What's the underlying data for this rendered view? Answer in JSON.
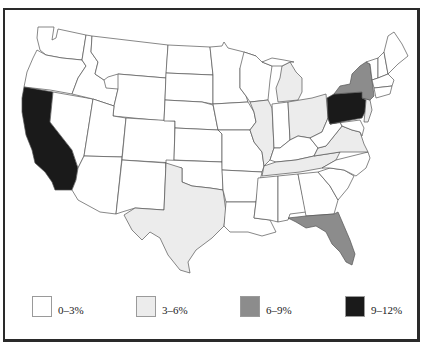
{
  "title": {
    "text": "",
    "note": "title text clipped at top edge, unreadable"
  },
  "map": {
    "region": "Contiguous United States",
    "colors": {
      "class_0_3": "#ffffff",
      "class_3_6": "#ececec",
      "class_6_9": "#8c8c8c",
      "class_9_12": "#1a1a1a",
      "border": "#555555"
    },
    "states": [
      {
        "name": "California",
        "class": "9-12%"
      },
      {
        "name": "Pennsylvania",
        "class": "9-12%"
      },
      {
        "name": "New York",
        "class": "6-9%"
      },
      {
        "name": "Florida",
        "class": "6-9%"
      },
      {
        "name": "Texas",
        "class": "3-6%"
      },
      {
        "name": "Michigan",
        "class": "3-6%"
      },
      {
        "name": "Illinois",
        "class": "3-6%"
      },
      {
        "name": "Ohio",
        "class": "3-6%"
      },
      {
        "name": "Virginia",
        "class": "3-6%"
      },
      {
        "name": "Tennessee",
        "class": "3-6%"
      },
      {
        "name": "New Jersey",
        "class": "3-6%"
      },
      {
        "name": "All other states",
        "class": "0-3%"
      }
    ]
  },
  "legend": {
    "items": [
      {
        "label": "0–3%",
        "color": "#ffffff"
      },
      {
        "label": "3–6%",
        "color": "#ececec"
      },
      {
        "label": "6–9%",
        "color": "#8c8c8c"
      },
      {
        "label": "9–12%",
        "color": "#1a1a1a"
      }
    ]
  }
}
